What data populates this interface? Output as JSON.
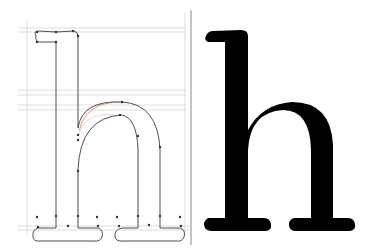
{
  "diagram": {
    "glyph": "h",
    "left_panel": {
      "label": "Outline with Bézier points and guidelines",
      "outline_color": "#444444",
      "guide_color": "#c8c8c8",
      "highlight_curve_color": "#d9534f",
      "point_color": "#333333"
    },
    "divider_color": "#888888",
    "right_panel": {
      "label": "Filled glyph",
      "fill_color": "#000000"
    }
  }
}
